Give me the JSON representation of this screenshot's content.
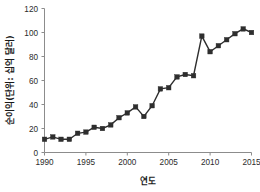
{
  "chart_data": {
    "type": "line",
    "title": "",
    "subtitle": "",
    "xlabel": "연도",
    "ylabel": "순이익(단위: 십억 달러)",
    "xlim": [
      1990,
      2015
    ],
    "ylim": [
      0,
      120
    ],
    "xticks": [
      1990,
      1995,
      2000,
      2005,
      2010,
      2015
    ],
    "yticks": [
      0,
      20,
      40,
      60,
      80,
      100,
      120
    ],
    "xtick_labels": [
      "1990",
      "1995",
      "2000",
      "2005",
      "2010",
      "2015"
    ],
    "ytick_labels": [
      "0",
      "20",
      "40",
      "60",
      "80",
      "100",
      "120"
    ],
    "grid": false,
    "legend": false,
    "legend_position": "none",
    "marker": "square",
    "marker_color": "#2e2e2e",
    "line_color": "#2e2e2e",
    "x": [
      1990,
      1991,
      1992,
      1993,
      1994,
      1995,
      1996,
      1997,
      1998,
      1999,
      2000,
      2001,
      2002,
      2003,
      2004,
      2005,
      2006,
      2007,
      2008,
      2009,
      2010,
      2011,
      2012,
      2013,
      2014,
      2015
    ],
    "values": [
      11,
      13,
      11,
      11,
      16,
      17,
      21,
      20,
      23,
      29,
      33,
      38,
      30,
      39,
      53,
      54,
      63,
      65,
      64,
      97,
      84,
      89,
      94,
      99,
      103,
      100
    ],
    "series": [
      {
        "name": "순이익",
        "values": [
          11,
          13,
          11,
          11,
          16,
          17,
          21,
          20,
          23,
          29,
          33,
          38,
          30,
          39,
          53,
          54,
          63,
          65,
          64,
          97,
          84,
          89,
          94,
          99,
          103,
          100
        ]
      }
    ]
  }
}
